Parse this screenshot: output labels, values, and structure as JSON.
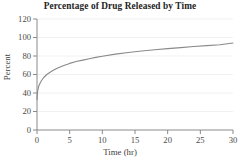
{
  "chart_data": {
    "type": "line",
    "title": "Percentage of Drug Released by Time",
    "xlabel": "Time (hr)",
    "ylabel": "Percent",
    "xlim": [
      0,
      30
    ],
    "ylim": [
      0,
      120
    ],
    "xticks": [
      0,
      5,
      10,
      15,
      20,
      25,
      30
    ],
    "yticks": [
      0,
      20,
      40,
      60,
      80,
      100,
      120
    ],
    "xtick_labels": [
      "0",
      "5",
      "10",
      "15",
      "20",
      "25",
      "30"
    ],
    "ytick_labels": [
      "0",
      "20",
      "40",
      "60",
      "80",
      "100",
      "120"
    ],
    "grid": "horizontal",
    "legend": "none",
    "series": [
      {
        "name": "Percent released",
        "color": "#8a8a8a",
        "x": [
          0,
          0.1,
          0.25,
          0.5,
          0.75,
          1,
          1.5,
          2,
          2.5,
          3,
          4,
          5,
          6,
          7,
          8,
          9,
          10,
          12,
          14,
          16,
          18,
          20,
          22,
          24,
          26,
          28,
          30
        ],
        "values": [
          33,
          42,
          47,
          51,
          54,
          56.5,
          60,
          62.5,
          64.5,
          66.5,
          69.5,
          72,
          74,
          75.5,
          77,
          78.5,
          79.8,
          82,
          83.8,
          85.4,
          86.8,
          88,
          89.1,
          90.2,
          91.2,
          92.1,
          94
        ]
      }
    ]
  },
  "axes": {
    "axis_color": "#8a8a8a",
    "grid_color": "#ededed",
    "text_color": "#3d3d3d"
  }
}
